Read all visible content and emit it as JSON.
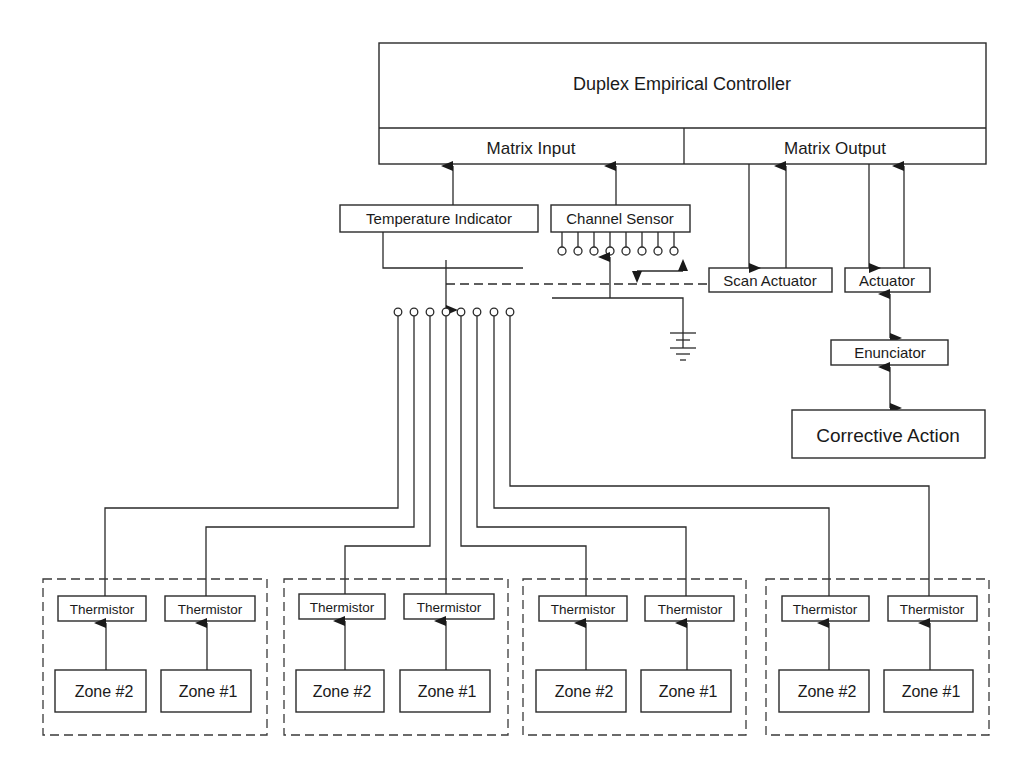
{
  "diagram": {
    "controller": {
      "title": "Duplex Empirical Controller",
      "input_label": "Matrix Input",
      "output_label": "Matrix Output"
    },
    "temperature_indicator": {
      "label": "Temperature Indicator"
    },
    "channel_sensor": {
      "label": "Channel Sensor",
      "terminal_count": 8
    },
    "scan_actuator": {
      "label": "Scan Actuator"
    },
    "actuator": {
      "label": "Actuator"
    },
    "enunciator": {
      "label": "Enunciator"
    },
    "corrective_action": {
      "label": "Corrective Action"
    },
    "scanner_terminal_count": 8,
    "zone_groups": [
      {
        "thermistors": [
          {
            "label": "Thermistor"
          },
          {
            "label": "Thermistor"
          }
        ],
        "zones": [
          {
            "label": "Zone #2"
          },
          {
            "label": "Zone #1"
          }
        ]
      },
      {
        "thermistors": [
          {
            "label": "Thermistor"
          },
          {
            "label": "Thermistor"
          }
        ],
        "zones": [
          {
            "label": "Zone #2"
          },
          {
            "label": "Zone #1"
          }
        ]
      },
      {
        "thermistors": [
          {
            "label": "Thermistor"
          },
          {
            "label": "Thermistor"
          }
        ],
        "zones": [
          {
            "label": "Zone #2"
          },
          {
            "label": "Zone #1"
          }
        ]
      },
      {
        "thermistors": [
          {
            "label": "Thermistor"
          },
          {
            "label": "Thermistor"
          }
        ],
        "zones": [
          {
            "label": "Zone #2"
          },
          {
            "label": "Zone #1"
          }
        ]
      }
    ],
    "icons": {
      "ground": "ground-symbol-icon",
      "bidirectional": "double-headed-arrow-icon"
    },
    "colors": {
      "line": "#2a2a2a",
      "text": "#1a1a1a",
      "background": "#ffffff"
    }
  }
}
